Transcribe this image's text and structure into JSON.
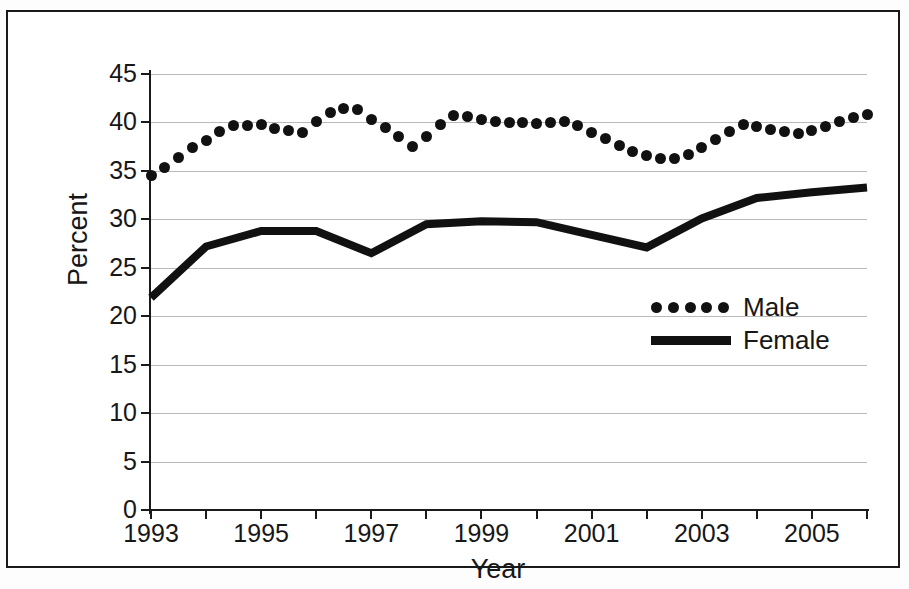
{
  "figure": {
    "background_color": "#ffffff",
    "border_color": "#1a1a1a"
  },
  "chart_data": {
    "type": "line",
    "title": "",
    "xlabel": "Year",
    "ylabel": "Percent",
    "xlim": [
      1993,
      2006
    ],
    "ylim": [
      0,
      45
    ],
    "ytick_values": [
      0,
      5,
      10,
      15,
      20,
      25,
      30,
      35,
      40,
      45
    ],
    "ytick_labels": [
      "0",
      "5",
      "10",
      "15",
      "20",
      "25",
      "30",
      "35",
      "40",
      "45"
    ],
    "xtick_values": [
      1993,
      1994,
      1995,
      1996,
      1997,
      1998,
      1999,
      2000,
      2001,
      2002,
      2003,
      2004,
      2005,
      2006
    ],
    "xtick_labels": [
      "1993",
      "",
      "1995",
      "",
      "1997",
      "",
      "1999",
      "",
      "2001",
      "",
      "2003",
      "",
      "2005",
      ""
    ],
    "grid": "horizontal",
    "grid_color": "#b9b9b9",
    "legend_position": "center-right",
    "series": [
      {
        "name": "Male",
        "style": "dotted",
        "marker": "circle",
        "color": "#111111",
        "x": [
          1993,
          1993.25,
          1993.5,
          1993.75,
          1994,
          1994.25,
          1994.5,
          1994.75,
          1995,
          1995.25,
          1995.5,
          1995.75,
          1996,
          1996.25,
          1996.5,
          1996.75,
          1997,
          1997.25,
          1997.5,
          1997.75,
          1998,
          1998.25,
          1998.5,
          1998.75,
          1999,
          1999.25,
          1999.5,
          1999.75,
          2000,
          2000.25,
          2000.5,
          2000.75,
          2001,
          2001.25,
          2001.5,
          2001.75,
          2002,
          2002.25,
          2002.5,
          2002.75,
          2003,
          2003.25,
          2003.5,
          2003.75,
          2004,
          2004.25,
          2004.5,
          2004.75,
          2005,
          2005.25,
          2005.5,
          2005.75,
          2006
        ],
        "values": [
          34.5,
          35.4,
          36.4,
          37.4,
          38.1,
          39.1,
          39.7,
          39.7,
          39.8,
          39.4,
          39.2,
          39.0,
          40.1,
          41.0,
          41.4,
          41.3,
          40.3,
          39.5,
          38.5,
          37.5,
          38.6,
          39.8,
          40.7,
          40.6,
          40.3,
          40.1,
          40.0,
          40.0,
          39.9,
          40.0,
          40.1,
          39.7,
          39.0,
          38.3,
          37.6,
          37.0,
          36.6,
          36.3,
          36.3,
          36.7,
          37.4,
          38.2,
          39.1,
          39.8,
          39.6,
          39.3,
          39.1,
          38.9,
          39.2,
          39.6,
          40.1,
          40.5,
          40.8
        ]
      },
      {
        "name": "Female",
        "style": "solid",
        "marker": "none",
        "color": "#111111",
        "x": [
          1993,
          1994,
          1995,
          1996,
          1997,
          1998,
          1999,
          2000,
          2001,
          2002,
          2003,
          2004,
          2005,
          2006
        ],
        "values": [
          21.9,
          27.2,
          28.8,
          28.8,
          26.5,
          29.5,
          29.8,
          29.7,
          28.4,
          27.1,
          30.1,
          32.2,
          32.8,
          33.3
        ]
      }
    ]
  },
  "legend": {
    "entries": [
      {
        "label": "Male",
        "style": "dotted"
      },
      {
        "label": "Female",
        "style": "solid"
      }
    ]
  }
}
